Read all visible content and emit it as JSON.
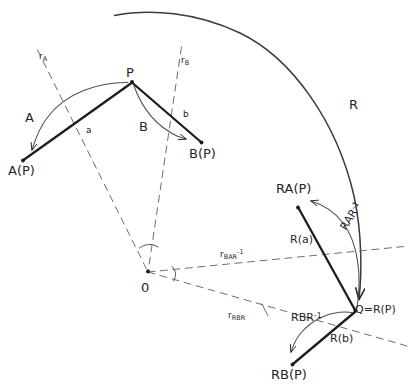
{
  "figure": {
    "kind": "hand-drawn-geometry-diagram",
    "background_color": "#ffffff",
    "ink_color": "#26262a",
    "width": 416,
    "height": 388
  },
  "points": {
    "P": {
      "label": "P",
      "x": 132,
      "y": 82
    },
    "AP": {
      "label": "A(P)",
      "x": 22,
      "y": 161
    },
    "BP": {
      "label": "B(P)",
      "x": 202,
      "y": 143
    },
    "O": {
      "label": "0",
      "x": 148,
      "y": 272
    },
    "RAP": {
      "label": "RA(P)",
      "x": 297,
      "y": 208
    },
    "Q": {
      "label": "Q=R(P)",
      "x": 356,
      "y": 311
    },
    "RBP": {
      "label": "RB(P)",
      "x": 292,
      "y": 365
    }
  },
  "labels": {
    "point_p": "P",
    "point_ap": "A(P)",
    "point_bp": "B(P)",
    "origin": "0",
    "point_rap": "RA(P)",
    "point_q": "Q=R(P)",
    "point_rbp": "RB(P)"
  },
  "operators": {
    "A": "A",
    "B": "B",
    "R": "R",
    "vector_a": "a",
    "vector_b": "b",
    "R_of_a": "R(a)",
    "R_of_b": "R(b)"
  },
  "conjugates": {
    "RAR_base": "RAR",
    "RAR_exp": "-1",
    "RBR_base": "RBR",
    "RBR_exp": "-1"
  },
  "axes": {
    "r_A": {
      "base": "r",
      "sub": "A"
    },
    "r_B": {
      "base": "r",
      "sub": "B"
    },
    "r_BAR": {
      "base": "r",
      "sub": "BAR",
      "sup": "-1"
    },
    "r_RBR": {
      "base": "r",
      "sub": "RBR"
    }
  },
  "geometry": {
    "big_arc_R": {
      "from": [
        115,
        15
      ],
      "to": [
        360,
        305
      ],
      "note": "large rotation arc R mapping P-region to Q-region"
    },
    "arc_A": {
      "note": "arc from P curving left-down to A(P)"
    },
    "arc_B": {
      "note": "arc from P curving right-down to B(P)"
    },
    "arc_RAR": {
      "note": "arc from Q curving up-left to RA(P)"
    },
    "arc_RBR": {
      "note": "arc from Q curving down-left to RB(P)"
    },
    "dashed_axes": [
      "r_A",
      "r_B",
      "r_BAR-1",
      "r_RBR"
    ],
    "angle_arcs_at_origin": 2
  }
}
